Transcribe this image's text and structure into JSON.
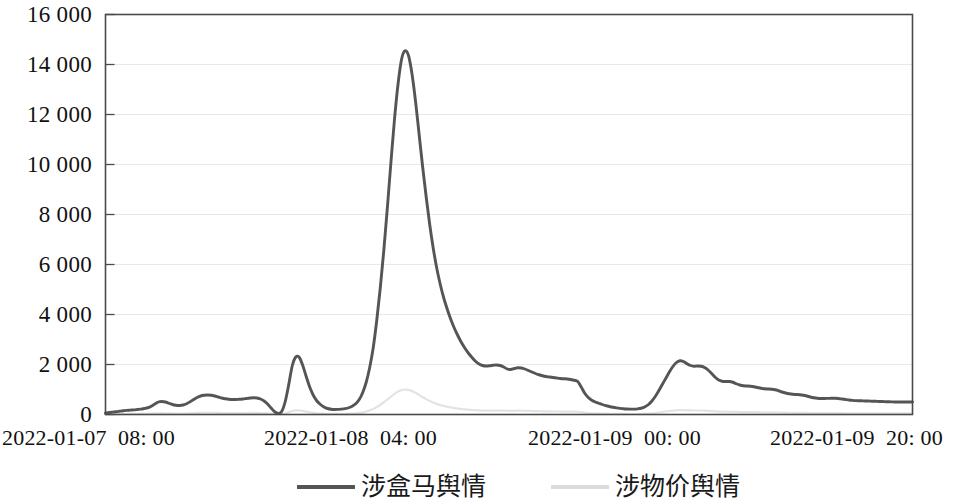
{
  "chart_data": {
    "type": "line",
    "title": "",
    "subtitle": "",
    "xlabel": "",
    "ylabel": "",
    "grid": true,
    "legend_position": "bottom",
    "ylim": [
      0,
      16000
    ],
    "ytick_labels": [
      "16 000",
      "14 000",
      "12 000",
      "10 000",
      "8 000",
      "6 000",
      "4 000",
      "2 000",
      "0"
    ],
    "ytick_values": [
      16000,
      14000,
      12000,
      10000,
      8000,
      6000,
      4000,
      2000,
      0
    ],
    "xtick_labels": [
      "2022-01-07  08: 00",
      "2022-01-08  04: 00",
      "2022-01-09  00: 00",
      "2022-01-09  20: 00"
    ],
    "xtick_positions": [
      0.0,
      0.333,
      0.667,
      1.0
    ],
    "xlim_labels": [
      "2022-01-07 08:00",
      "2022-01-09 20:00"
    ],
    "series": [
      {
        "name": "涉盒马舆情",
        "color": "#555555",
        "values": [
          60,
          80,
          95,
          110,
          130,
          150,
          165,
          175,
          185,
          200,
          215,
          240,
          270,
          330,
          420,
          500,
          520,
          500,
          450,
          400,
          370,
          360,
          380,
          430,
          510,
          600,
          680,
          740,
          770,
          780,
          770,
          740,
          700,
          660,
          630,
          610,
          600,
          600,
          610,
          620,
          640,
          660,
          670,
          660,
          620,
          540,
          420,
          260,
          110,
          40,
          120,
          520,
          1200,
          1950,
          2300,
          2280,
          1950,
          1500,
          1080,
          760,
          540,
          400,
          300,
          240,
          210,
          200,
          205,
          215,
          235,
          270,
          330,
          430,
          600,
          880,
          1300,
          1900,
          2700,
          3800,
          5100,
          6600,
          8300,
          10100,
          11800,
          13200,
          14200,
          14550,
          14350,
          13600,
          12500,
          11200,
          9900,
          8700,
          7600,
          6650,
          5850,
          5200,
          4650,
          4200,
          3800,
          3450,
          3150,
          2880,
          2650,
          2450,
          2280,
          2130,
          2020,
          1960,
          1940,
          1950,
          1970,
          1980,
          1960,
          1900,
          1820,
          1800,
          1840,
          1870,
          1860,
          1820,
          1760,
          1700,
          1640,
          1590,
          1550,
          1520,
          1500,
          1480,
          1460,
          1440,
          1430,
          1420,
          1400,
          1370,
          1320,
          1100,
          850,
          680,
          570,
          500,
          450,
          400,
          355,
          320,
          290,
          265,
          245,
          230,
          220,
          215,
          215,
          225,
          250,
          300,
          390,
          530,
          720,
          950,
          1200,
          1450,
          1700,
          1920,
          2080,
          2150,
          2120,
          2030,
          1960,
          1930,
          1940,
          1930,
          1880,
          1780,
          1640,
          1490,
          1380,
          1330,
          1320,
          1320,
          1290,
          1230,
          1180,
          1150,
          1140,
          1130,
          1110,
          1080,
          1050,
          1030,
          1020,
          1010,
          990,
          950,
          900,
          860,
          830,
          810,
          800,
          790,
          770,
          740,
          700,
          670,
          650,
          640,
          640,
          645,
          650,
          650,
          640,
          620,
          600,
          580,
          565,
          555,
          550,
          545,
          540,
          535,
          530,
          525,
          520,
          515,
          510,
          505,
          500,
          500,
          500,
          500,
          500,
          500
        ]
      },
      {
        "name": "涉物价舆情",
        "color": "#e3e3e3",
        "values": [
          10,
          12,
          14,
          16,
          18,
          20,
          22,
          24,
          26,
          28,
          30,
          33,
          36,
          40,
          45,
          50,
          52,
          50,
          46,
          42,
          40,
          39,
          40,
          44,
          50,
          58,
          64,
          68,
          70,
          70,
          69,
          67,
          64,
          61,
          59,
          58,
          57,
          57,
          58,
          59,
          61,
          63,
          64,
          63,
          60,
          54,
          45,
          32,
          20,
          12,
          16,
          40,
          90,
          140,
          165,
          163,
          142,
          112,
          86,
          64,
          50,
          40,
          33,
          28,
          25,
          24,
          25,
          26,
          28,
          32,
          38,
          48,
          64,
          88,
          120,
          165,
          225,
          300,
          390,
          490,
          600,
          715,
          825,
          915,
          975,
          1000,
          985,
          935,
          865,
          780,
          695,
          615,
          545,
          480,
          425,
          380,
          342,
          310,
          282,
          258,
          238,
          220,
          205,
          192,
          180,
          170,
          162,
          158,
          156,
          157,
          158,
          159,
          158,
          154,
          149,
          147,
          150,
          152,
          151,
          148,
          144,
          140,
          135,
          131,
          128,
          125,
          123,
          122,
          120,
          119,
          118,
          117,
          116,
          114,
          110,
          93,
          73,
          59,
          50,
          44,
          40,
          36,
          32,
          29,
          27,
          25,
          23,
          22,
          21,
          20,
          20,
          21,
          23,
          27,
          34,
          45,
          60,
          79,
          99,
          120,
          140,
          158,
          171,
          177,
          175,
          168,
          162,
          160,
          160,
          160,
          156,
          148,
          137,
          125,
          116,
          112,
          111,
          111,
          108,
          104,
          100,
          97,
          96,
          95,
          94,
          92,
          89,
          87,
          86,
          85,
          84,
          81,
          77,
          73,
          70,
          69,
          68,
          67,
          65,
          63,
          60,
          57,
          55,
          54,
          54,
          55,
          55,
          55,
          54,
          53,
          51,
          50,
          48,
          47,
          47,
          46,
          46,
          45,
          45,
          45,
          44,
          44,
          43,
          43,
          42,
          42,
          42,
          42,
          42,
          42
        ]
      }
    ],
    "annotations": {
      "peak_value": 14550,
      "peak_label": "",
      "axis_color": "#4a4a4a",
      "grid_color": "#e8e8e8",
      "background": "#ffffff"
    }
  },
  "legend": {
    "entries": [
      {
        "label": "涉盒马舆情",
        "color": "#555555"
      },
      {
        "label": "涉物价舆情",
        "color": "#e3e3e3"
      }
    ]
  }
}
